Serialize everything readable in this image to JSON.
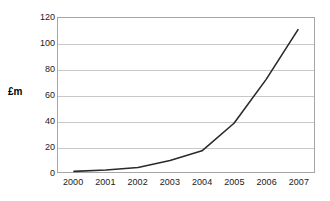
{
  "chart_data": {
    "type": "line",
    "title": "",
    "xlabel": "",
    "ylabel": "£m",
    "categories": [
      "2000",
      "2001",
      "2002",
      "2003",
      "2004",
      "2005",
      "2006",
      "2007"
    ],
    "values": [
      0.5,
      1.5,
      3.5,
      9,
      16.5,
      38,
      72,
      111
    ],
    "series": [
      {
        "name": "",
        "values": [
          0.5,
          1.5,
          3.5,
          9,
          16.5,
          38,
          72,
          111
        ]
      }
    ],
    "ylim": [
      0,
      120
    ],
    "yticks": [
      0,
      20,
      40,
      60,
      80,
      100,
      120
    ],
    "ytick_labels": [
      "0",
      "20",
      "40",
      "60",
      "80",
      "100",
      "120"
    ],
    "grid": true,
    "grid_axis": "y",
    "legend": false,
    "legend_position": "none",
    "colors": {
      "line": "#2a2a2a",
      "gridline": "#c8c8c8",
      "plot_border": "#a6a6a6",
      "background": "#ffffff",
      "text": "#1a1a1a"
    },
    "markers": false,
    "line_width": 1.6
  }
}
